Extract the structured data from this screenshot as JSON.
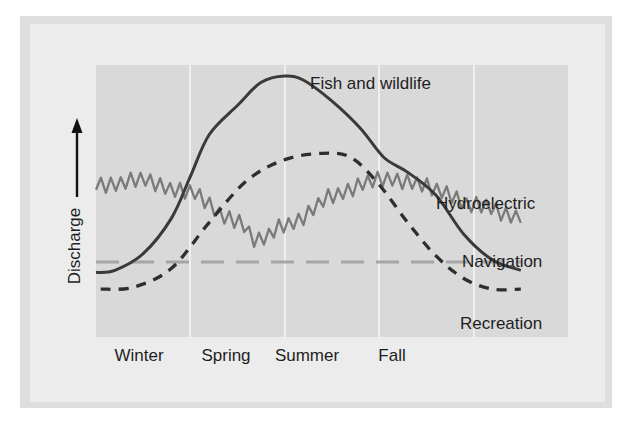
{
  "chart_data": {
    "type": "line",
    "title": "",
    "xlabel": "",
    "ylabel": "Discharge",
    "y_arrow": "up",
    "grid": "vertical season dividers",
    "x_domain": [
      0,
      5
    ],
    "y_domain": [
      0,
      100
    ],
    "categories": [
      "Winter",
      "Spring",
      "Summer",
      "Fall"
    ],
    "series": [
      {
        "name": "Fish and wildlife",
        "style": "solid",
        "color": "#3a3a3a",
        "label_position": "top-right of peak",
        "x": [
          0,
          0.2,
          0.5,
          0.8,
          1.0,
          1.2,
          1.5,
          1.75,
          2.0,
          2.2,
          2.5,
          2.8,
          3.05,
          3.3,
          3.6,
          3.9,
          4.2,
          4.5
        ],
        "y": [
          6,
          7,
          15,
          32,
          52,
          72,
          86,
          97,
          100,
          98,
          88,
          75,
          61,
          54,
          43,
          24,
          12,
          7
        ]
      },
      {
        "name": "Recreation",
        "style": "dashed",
        "color": "#2e2e2e",
        "label_position": "bottom-right",
        "x": [
          0.05,
          0.4,
          0.8,
          1.2,
          1.6,
          2.0,
          2.4,
          2.7,
          3.0,
          3.3,
          3.6,
          3.9,
          4.2,
          4.5
        ],
        "y": [
          -2,
          -1,
          8,
          30,
          50,
          60,
          63,
          61,
          48,
          30,
          14,
          3,
          -2,
          -2
        ]
      },
      {
        "name": "Hydroelectric",
        "style": "jagged",
        "color": "#7a7a7a",
        "label_position": "right",
        "x": [
          0,
          0.5,
          1.0,
          1.5,
          1.7,
          2.0,
          2.5,
          2.9,
          3.3,
          3.7,
          4.0,
          4.5
        ],
        "y": [
          48,
          50,
          44,
          30,
          22,
          28,
          42,
          50,
          50,
          44,
          38,
          33
        ]
      },
      {
        "name": "Navigation",
        "style": "long-dash",
        "color": "#a6a6a6",
        "label_position": "right",
        "x": [
          0,
          4.5
        ],
        "y": [
          11,
          11
        ]
      }
    ],
    "labels": {
      "fish": "Fish and wildlife",
      "hydro": "Hydroelectric",
      "navigation": "Navigation",
      "recreation": "Recreation"
    }
  },
  "colors": {
    "page_background": "#ffffff",
    "frame_border": "#dedede",
    "frame_fill": "#ececec",
    "plot_fill": "#d9d9d9",
    "divider": "#f5f5f5",
    "text": "#1e1e1e"
  }
}
